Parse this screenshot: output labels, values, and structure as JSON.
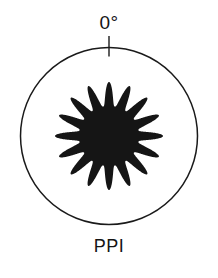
{
  "figure": {
    "kind": "polar-radiation-pattern",
    "caption_top": "0°",
    "caption_bottom": "PPI",
    "background_color": "#ffffff",
    "outline_color": "#1a1a1a",
    "lobe_fill_color": "#151515"
  },
  "chart_data": {
    "type": "line",
    "title": "PPI",
    "subtitle": "",
    "xlabel": "",
    "ylabel": "",
    "plot_style": "polar",
    "grid": false,
    "legend_position": "none",
    "annotations": [
      {
        "text": "0°",
        "angle_deg": 0,
        "position": "above-circle-top"
      },
      {
        "text": "PPI",
        "angle_deg": 180,
        "position": "below-circle-bottom"
      }
    ],
    "axis_marks": [
      {
        "label": "0°",
        "angle_deg": 0,
        "tick": true
      }
    ],
    "theta_range_deg": [
      0,
      360
    ],
    "r_range": [
      0,
      1.0
    ],
    "boundary_circle_r": 1.0,
    "lobe_count": 16,
    "lobe_peak_r": 0.61,
    "lobe_null_r": 0.34,
    "lobe_angular_period_deg": 22.5,
    "series": [
      {
        "name": "main lobes",
        "kind": "polar-rosette",
        "n_lobes": 16,
        "r_max": 0.61,
        "r_min": 0.34,
        "sharpness": 2.6,
        "values_deg_r": [
          [
            0,
            0.61
          ],
          [
            11.25,
            0.34
          ],
          [
            22.5,
            0.61
          ],
          [
            33.75,
            0.34
          ],
          [
            45,
            0.61
          ],
          [
            56.25,
            0.34
          ],
          [
            67.5,
            0.61
          ],
          [
            78.75,
            0.34
          ],
          [
            90,
            0.61
          ],
          [
            101.25,
            0.34
          ],
          [
            112.5,
            0.61
          ],
          [
            123.75,
            0.34
          ],
          [
            135,
            0.61
          ],
          [
            146.25,
            0.34
          ],
          [
            157.5,
            0.61
          ],
          [
            168.75,
            0.34
          ],
          [
            180,
            0.61
          ],
          [
            191.25,
            0.34
          ],
          [
            202.5,
            0.61
          ],
          [
            213.75,
            0.34
          ],
          [
            225,
            0.61
          ],
          [
            236.25,
            0.34
          ],
          [
            247.5,
            0.61
          ],
          [
            258.75,
            0.34
          ],
          [
            270,
            0.61
          ],
          [
            281.25,
            0.34
          ],
          [
            292.5,
            0.61
          ],
          [
            303.75,
            0.34
          ],
          [
            315,
            0.61
          ],
          [
            326.25,
            0.34
          ],
          [
            337.5,
            0.61
          ],
          [
            348.75,
            0.34
          ]
        ]
      },
      {
        "name": "display boundary",
        "kind": "circle",
        "r": 1.0
      }
    ],
    "geometry_px": {
      "center_x": 109,
      "center_y": 136,
      "circle_radius": 88.5,
      "lobe_outer_radius": 54,
      "lobe_inner_radius": 30,
      "tick_inner_radius": 88.5,
      "tick_outer_radius": 100
    }
  }
}
